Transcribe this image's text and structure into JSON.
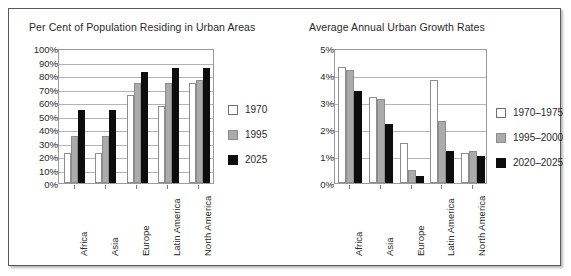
{
  "figure": {
    "panels": [
      {
        "id": "urban-population-share",
        "title": "Per Cent of Population Residing in Urban Areas"
      },
      {
        "id": "urban-growth-rates",
        "title": "Average Annual Urban Growth Rates"
      }
    ]
  },
  "chart_data": [
    {
      "type": "bar",
      "title": "Per Cent of Population Residing in Urban Areas",
      "xlabel": "",
      "ylabel": "",
      "ylim": [
        0,
        100
      ],
      "ytick_step": 10,
      "ytick_labels": [
        "0%",
        "10%",
        "20%",
        "30%",
        "40%",
        "50%",
        "60%",
        "70%",
        "80%",
        "90%",
        "100%"
      ],
      "grid": true,
      "legend_position": "right",
      "categories": [
        "Africa",
        "Asia",
        "Europe",
        "Latin America",
        "North America"
      ],
      "series": [
        {
          "name": "1970",
          "color": "#ffffff",
          "values": [
            22,
            22,
            65,
            57,
            74
          ]
        },
        {
          "name": "1995",
          "color": "#ababab",
          "values": [
            35,
            35,
            74,
            74,
            76
          ]
        },
        {
          "name": "2025",
          "color": "#0d0d0d",
          "values": [
            54,
            54,
            82,
            85,
            85
          ]
        }
      ]
    },
    {
      "type": "bar",
      "title": "Average Annual Urban Growth Rates",
      "xlabel": "",
      "ylabel": "",
      "ylim": [
        0,
        5
      ],
      "ytick_step": 1,
      "ytick_labels": [
        "0%",
        "1%",
        "2%",
        "3%",
        "4%",
        "5%"
      ],
      "grid": true,
      "legend_position": "right",
      "categories": [
        "Africa",
        "Asia",
        "Europe",
        "Latin America",
        "North America"
      ],
      "series": [
        {
          "name": "1970–1975",
          "color": "#ffffff",
          "values": [
            4.3,
            3.2,
            1.5,
            3.8,
            1.1
          ]
        },
        {
          "name": "1995–2000",
          "color": "#ababab",
          "values": [
            4.2,
            3.1,
            0.5,
            2.3,
            1.2
          ]
        },
        {
          "name": "2020–2025",
          "color": "#0d0d0d",
          "values": [
            3.4,
            2.2,
            0.25,
            1.2,
            1.0
          ]
        }
      ]
    }
  ]
}
